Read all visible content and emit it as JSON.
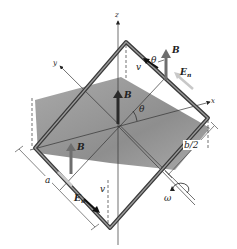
{
  "figure": {
    "type": "physics-diagram",
    "axes": {
      "x": "x",
      "y": "y",
      "z": "z"
    },
    "labels": {
      "B_center": "B",
      "B_top": "B",
      "B_left": "B",
      "v_top": "v",
      "v_bottom": "v",
      "En_top": "E",
      "En_top_sub": "n",
      "En_bottom": "E",
      "En_bottom_sub": "n",
      "theta_center": "θ",
      "theta_top": "θ",
      "dim_a": "a",
      "dim_b2": "b/2",
      "omega": "ω"
    },
    "colors": {
      "loop": "#3a3a3a",
      "loop_inner": "#9a9a9a",
      "plane_shadow": "#808080",
      "field_arrow": "#6e6e6e",
      "En_arrow": "#c8c8c8",
      "axis": "#333333"
    }
  }
}
